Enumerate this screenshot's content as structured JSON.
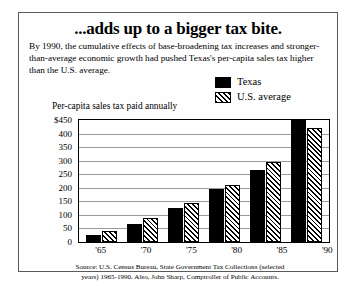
{
  "headline": "...adds up to a bigger tax bite.",
  "deck": "By 1990, the cumulative effects of base-broadening tax increases and stronger-than-average economic growth had pushed Texas's per-capita sales tax higher than the U.S. average.",
  "legend": {
    "position": "top-right",
    "items": [
      {
        "label": "Texas",
        "swatch": "solid-black-swatch",
        "color": "#000000"
      },
      {
        "label": "U.S. average",
        "swatch": "diagonal-hatch-swatch",
        "color": "#000000"
      }
    ]
  },
  "axis_title": "Per-capita sales tax paid annually",
  "source": {
    "line1": "Source:  U.S. Census Bureau, State Government Tax Collections (selected",
    "line2": "years) 1965-1990. Also, John Sharp, Comptroller of Public Accounts."
  },
  "chart_data": {
    "type": "bar",
    "title": "...adds up to a bigger tax bite.",
    "subtitle": "By 1990, the cumulative effects of base-broadening tax increases and stronger-than-average economic growth had pushed Texas's per-capita sales tax higher than the U.S. average.",
    "xlabel": "",
    "ylabel": "Per-capita sales tax paid annually",
    "categories": [
      "'65",
      "'70",
      "'75",
      "'80",
      "'85",
      "'90"
    ],
    "series": [
      {
        "name": "Texas",
        "values": [
          25,
          65,
          125,
          195,
          265,
          450
        ]
      },
      {
        "name": "U.S. average",
        "values": [
          40,
          90,
          145,
          210,
          295,
          420
        ]
      }
    ],
    "ylim": [
      0,
      450
    ],
    "ytick_labels": [
      "$450",
      "400",
      "350",
      "300",
      "250",
      "200",
      "150",
      "100",
      "50",
      "0"
    ],
    "ytick_values": [
      450,
      400,
      350,
      300,
      250,
      200,
      150,
      100,
      50,
      0
    ],
    "grid": true,
    "legend_position": "outside-top-right"
  }
}
